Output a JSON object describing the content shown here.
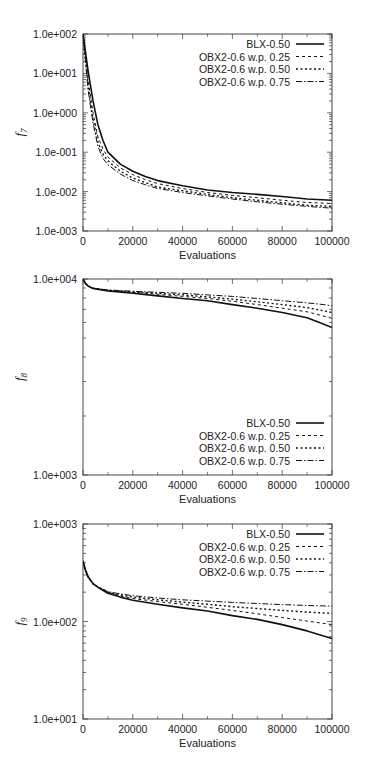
{
  "chart_data": [
    {
      "type": "line",
      "title": "",
      "xlabel": "Evaluations",
      "ylabel": "f7",
      "ylabel_base": "f",
      "ylabel_sub": "7",
      "yscale": "log",
      "xlim": [
        0,
        100000
      ],
      "ylim": [
        0.001,
        100
      ],
      "xticks": [
        0,
        20000,
        40000,
        60000,
        80000,
        100000
      ],
      "xtick_labels": [
        "0",
        "20000",
        "40000",
        "60000",
        "80000",
        "100000"
      ],
      "yticks": [
        0.001,
        0.01,
        0.1,
        1,
        10,
        100
      ],
      "ytick_labels": [
        "1.0e-003",
        "1.0e-002",
        "1.0e-001",
        "1.0e+000",
        "1.0e+001",
        "1.0e+002"
      ],
      "legend_position": "top-right",
      "grid": false,
      "x": [
        0,
        2000,
        4000,
        6000,
        8000,
        10000,
        15000,
        20000,
        25000,
        30000,
        40000,
        50000,
        60000,
        70000,
        80000,
        90000,
        100000
      ],
      "series": [
        {
          "name": "BLX-0.50",
          "style": "solid",
          "values": [
            100,
            12,
            2.0,
            0.5,
            0.2,
            0.1,
            0.05,
            0.033,
            0.024,
            0.019,
            0.014,
            0.011,
            0.0095,
            0.0085,
            0.0075,
            0.0065,
            0.006
          ]
        },
        {
          "name": "OBX2-0.6 w.p. 0.25",
          "style": "dashed",
          "values": [
            100,
            7,
            1.0,
            0.25,
            0.12,
            0.075,
            0.04,
            0.027,
            0.02,
            0.016,
            0.012,
            0.0095,
            0.008,
            0.007,
            0.006,
            0.0053,
            0.005
          ]
        },
        {
          "name": "OBX2-0.6 w.p. 0.50",
          "style": "dotted",
          "values": [
            100,
            5,
            0.7,
            0.18,
            0.09,
            0.06,
            0.033,
            0.022,
            0.017,
            0.013,
            0.0105,
            0.0085,
            0.007,
            0.006,
            0.0052,
            0.0045,
            0.0042
          ]
        },
        {
          "name": "OBX2-0.6 w.p. 0.75",
          "style": "dashdot",
          "values": [
            100,
            4,
            0.55,
            0.14,
            0.07,
            0.048,
            0.028,
            0.019,
            0.015,
            0.012,
            0.0095,
            0.0078,
            0.0065,
            0.0055,
            0.0048,
            0.0042,
            0.0038
          ]
        }
      ]
    },
    {
      "type": "line",
      "title": "",
      "xlabel": "Evaluations",
      "ylabel": "f8",
      "ylabel_base": "f",
      "ylabel_sub": "8",
      "yscale": "log",
      "xlim": [
        0,
        100000
      ],
      "ylim": [
        1000,
        10000
      ],
      "xticks": [
        0,
        20000,
        40000,
        60000,
        80000,
        100000
      ],
      "xtick_labels": [
        "0",
        "20000",
        "40000",
        "60000",
        "80000",
        "100000"
      ],
      "yticks": [
        1000,
        10000
      ],
      "ytick_labels": [
        "1.0e+003",
        "1.0e+004"
      ],
      "legend_position": "bottom-right",
      "grid": false,
      "x": [
        0,
        1000,
        2000,
        4000,
        10000,
        20000,
        30000,
        40000,
        50000,
        60000,
        70000,
        80000,
        90000,
        95000,
        100000
      ],
      "series": [
        {
          "name": "BLX-0.50",
          "style": "solid",
          "values": [
            10000,
            9500,
            9200,
            8950,
            8700,
            8450,
            8200,
            7950,
            7750,
            7400,
            7100,
            6750,
            6350,
            6000,
            5650
          ]
        },
        {
          "name": "OBX2-0.6 w.p. 0.25",
          "style": "dashed",
          "values": [
            10000,
            9500,
            9200,
            8950,
            8750,
            8550,
            8350,
            8150,
            7950,
            7700,
            7400,
            7100,
            6800,
            6550,
            6300
          ]
        },
        {
          "name": "OBX2-0.6 w.p. 0.50",
          "style": "dotted",
          "values": [
            10000,
            9500,
            9200,
            8950,
            8750,
            8600,
            8450,
            8300,
            8100,
            7900,
            7650,
            7400,
            7150,
            6950,
            6750
          ]
        },
        {
          "name": "OBX2-0.6 w.p. 0.75",
          "style": "dashdot",
          "values": [
            10000,
            9500,
            9200,
            8950,
            8800,
            8650,
            8550,
            8450,
            8300,
            8150,
            7950,
            7750,
            7550,
            7450,
            7300
          ]
        }
      ]
    },
    {
      "type": "line",
      "title": "",
      "xlabel": "Evaluations",
      "ylabel": "f9",
      "ylabel_base": "f",
      "ylabel_sub": "9",
      "yscale": "log",
      "xlim": [
        0,
        100000
      ],
      "ylim": [
        10,
        1000
      ],
      "xticks": [
        0,
        20000,
        40000,
        60000,
        80000,
        100000
      ],
      "xtick_labels": [
        "0",
        "20000",
        "40000",
        "60000",
        "80000",
        "100000"
      ],
      "yticks": [
        10,
        100,
        1000
      ],
      "ytick_labels": [
        "1.0e+001",
        "1.0e+002",
        "1.0e+003"
      ],
      "legend_position": "top-right",
      "grid": false,
      "x": [
        0,
        1000,
        2000,
        4000,
        6000,
        10000,
        15000,
        20000,
        30000,
        40000,
        50000,
        60000,
        70000,
        80000,
        90000,
        100000
      ],
      "series": [
        {
          "name": "BLX-0.50",
          "style": "solid",
          "values": [
            420,
            340,
            290,
            245,
            225,
            195,
            178,
            165,
            150,
            138,
            128,
            115,
            105,
            93,
            80,
            67
          ]
        },
        {
          "name": "OBX2-0.6 w.p. 0.25",
          "style": "dashed",
          "values": [
            400,
            330,
            285,
            243,
            225,
            198,
            183,
            172,
            160,
            150,
            140,
            130,
            120,
            110,
            101,
            93
          ]
        },
        {
          "name": "OBX2-0.6 w.p. 0.50",
          "style": "dotted",
          "values": [
            400,
            330,
            285,
            243,
            226,
            200,
            188,
            178,
            167,
            158,
            150,
            142,
            136,
            130,
            125,
            121
          ]
        },
        {
          "name": "OBX2-0.6 w.p. 0.75",
          "style": "dashdot",
          "values": [
            400,
            330,
            285,
            243,
            226,
            202,
            192,
            184,
            174,
            167,
            162,
            157,
            153,
            149,
            146,
            144
          ]
        }
      ]
    }
  ],
  "layout": {
    "charts": [
      {
        "top": 0,
        "plot": {
          "left": 83,
          "top": 34,
          "right": 332,
          "bottom": 231
        }
      },
      {
        "top": 0,
        "plot": {
          "left": 83,
          "top": 279,
          "right": 332,
          "bottom": 475
        }
      },
      {
        "top": 0,
        "plot": {
          "left": 83,
          "top": 524,
          "right": 332,
          "bottom": 719
        }
      }
    ]
  },
  "colors": {
    "line": "#111111",
    "axis": "#333333",
    "background": "#ffffff"
  }
}
